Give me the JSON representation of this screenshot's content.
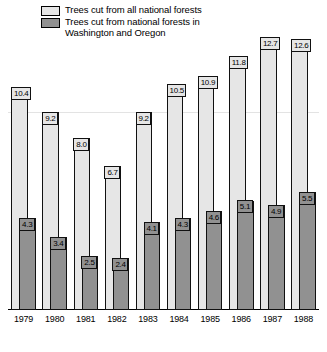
{
  "legend": {
    "items": [
      {
        "label": "Trees cut from all national forests",
        "color": "#e6e6e6",
        "swatch": "light-gray-swatch"
      },
      {
        "label": "Trees cut from national forests in\nWashington and Oregon",
        "color": "#919191",
        "swatch": "dark-gray-swatch"
      }
    ]
  },
  "chart_data": {
    "type": "bar",
    "title": "",
    "xlabel": "",
    "ylabel": "",
    "grid": true,
    "gridlines": [
      9.2
    ],
    "legend_position": "top-left",
    "ylim": [
      0,
      13.6
    ],
    "categories": [
      "1979",
      "1980",
      "1981",
      "1982",
      "1983",
      "1984",
      "1985",
      "1986",
      "1987",
      "1988"
    ],
    "series": [
      {
        "name": "Trees cut from all national forests",
        "color": "#e6e6e6",
        "values": [
          10.4,
          9.2,
          8.0,
          6.7,
          9.2,
          10.5,
          10.9,
          11.8,
          12.7,
          12.6
        ],
        "labels": [
          "10.4",
          "9.2",
          "8.0",
          "6.7",
          "9.2",
          "10.5",
          "10.9",
          "11.8",
          "12.7",
          "12.6"
        ]
      },
      {
        "name": "Trees cut from national forests in Washington and Oregon",
        "color": "#919191",
        "values": [
          4.3,
          3.4,
          2.5,
          2.4,
          4.1,
          4.3,
          4.6,
          5.1,
          4.9,
          5.5
        ],
        "labels": [
          "4.3",
          "3.4",
          "2.5",
          "2.4",
          "4.1",
          "4.3",
          "4.6",
          "5.1",
          "4.9",
          "5.5"
        ]
      }
    ]
  }
}
